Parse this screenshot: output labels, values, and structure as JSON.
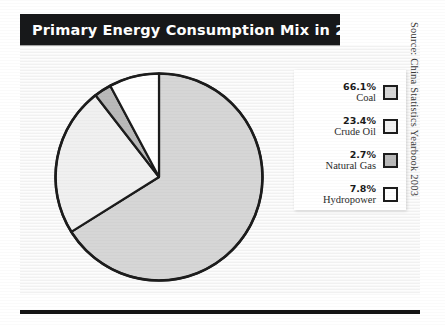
{
  "figure": {
    "title": "Primary Energy Consumption Mix in 2002",
    "source_note": "Source: China Statistics Yearbook 2003"
  },
  "legend": {
    "entries": [
      {
        "percent": "66.1%",
        "label": "Coal",
        "swatch": "#d6d6d6"
      },
      {
        "percent": "23.4%",
        "label": "Crude Oil",
        "swatch": "#f0f0f0"
      },
      {
        "percent": "2.7%",
        "label": "Natural Gas",
        "swatch": "#b9b9b9"
      },
      {
        "percent": "7.8%",
        "label": "Hydropower",
        "swatch": "#ffffff"
      }
    ]
  },
  "colors": {
    "title_bar": "#17181a",
    "title_text": "#ffffff",
    "outline": "#1c1c1c",
    "canvas": "#fbfbfb",
    "bottom_rule": "#141414"
  },
  "chart_data": {
    "type": "pie",
    "title": "Primary Energy Consumption Mix in 2002",
    "subtitle": "",
    "xlabel": "",
    "ylabel": "",
    "unit": "percent",
    "start_angle_deg": 90,
    "direction": "clockwise",
    "legend_position": "right",
    "grid": false,
    "labels": [
      "Coal",
      "Crude Oil",
      "Natural Gas",
      "Hydropower"
    ],
    "values": [
      66.1,
      23.4,
      2.7,
      7.8
    ],
    "slice_colors": [
      "#d6d6d6",
      "#f0f0f0",
      "#b9b9b9",
      "#ffffff"
    ],
    "annotations": [
      "Source: China Statistics Yearbook 2003"
    ]
  }
}
